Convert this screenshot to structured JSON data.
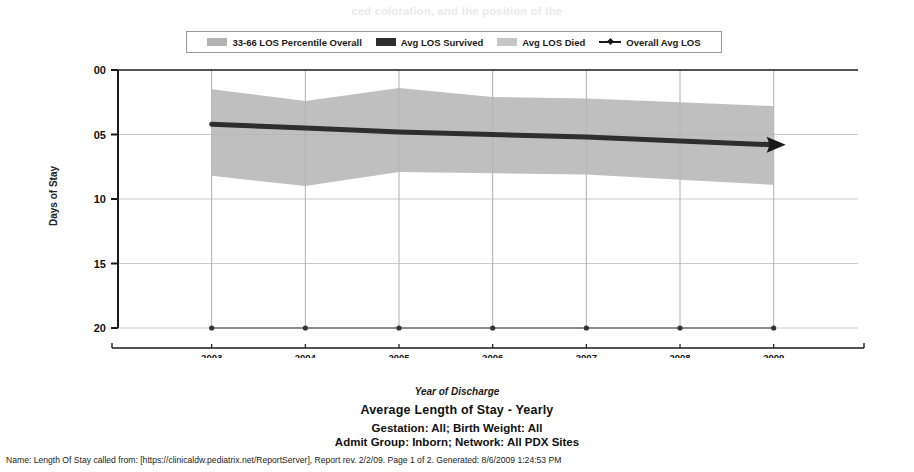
{
  "ghost_header": "ced coloration, and the position of the",
  "legend": {
    "items": [
      {
        "label": "33-66 LOS Percentile Overall",
        "swatch": "band-swatch-icon",
        "color": "#b4b4b4"
      },
      {
        "label": "Avg LOS Survived",
        "swatch": "solid-swatch-icon",
        "color": "#2e2e2e"
      },
      {
        "label": "Avg LOS Died",
        "swatch": "solid-swatch-icon",
        "color": "#c6c6c6"
      },
      {
        "label": "Overall Avg LOS",
        "swatch": "line-marker-icon",
        "color": "#1a1a1a"
      }
    ]
  },
  "axes": {
    "y_title": "Days of Stay",
    "y_ticks": [
      "20",
      "15",
      "10",
      "05",
      "00"
    ],
    "x_title": "Year of Discharge",
    "x_ticks": [
      "2003",
      "2004",
      "2005",
      "2006",
      "2007",
      "2008",
      "2009"
    ]
  },
  "captions": {
    "title": "Average Length of Stay - Yearly",
    "subtitle_1": "Gestation: All; Birth Weight: All",
    "subtitle_2": "Admit Group: Inborn; Network: All PDX Sites"
  },
  "footer": {
    "text": "Name: Length Of Stay called from: [https://clinicaldw.pediatrix.net/ReportServer], Report rev. 2/2/09. Page 1 of 2. Generated: 8/6/2009 1:24:53 PM"
  },
  "chart_data": {
    "type": "area",
    "title": "Average Length of Stay - Yearly",
    "xlabel": "Year of Discharge",
    "ylabel": "Days of Stay",
    "x": [
      2003,
      2004,
      2005,
      2006,
      2007,
      2008,
      2009
    ],
    "categories": [
      "2003",
      "2004",
      "2005",
      "2006",
      "2007",
      "2008",
      "2009"
    ],
    "ylim": [
      0,
      20
    ],
    "xlim": [
      2002.0,
      2009.9
    ],
    "ytick_values": [
      0,
      5,
      10,
      15,
      20
    ],
    "grid": true,
    "legend_position": "top-center",
    "series": [
      {
        "name": "33-66 LOS Percentile Overall",
        "type": "band",
        "color": "#b4b4b4",
        "upper": [
          18.5,
          17.6,
          18.6,
          17.9,
          17.8,
          17.5,
          17.2
        ],
        "lower": [
          11.8,
          11.0,
          12.1,
          12.0,
          11.9,
          11.5,
          11.1
        ]
      },
      {
        "name": "Avg LOS Survived",
        "type": "line",
        "color": "#2e2e2e",
        "values": [
          15.8,
          15.5,
          15.2,
          15.0,
          14.8,
          14.5,
          14.2
        ]
      },
      {
        "name": "Avg LOS Died",
        "type": "line",
        "color": "#333333",
        "values": [
          0.0,
          0.0,
          0.0,
          0.0,
          0.0,
          0.0,
          0.0
        ]
      },
      {
        "name": "Overall Avg LOS",
        "type": "line-arrow",
        "color": "#1a1a1a",
        "values": [
          15.8,
          15.5,
          15.2,
          15.0,
          14.8,
          14.5,
          14.2
        ]
      }
    ]
  }
}
